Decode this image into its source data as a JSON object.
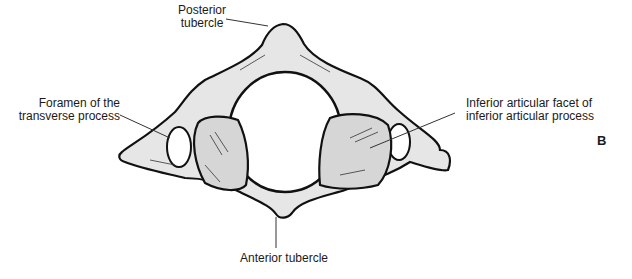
{
  "figure": {
    "panel_letter": "B",
    "colors": {
      "bone_fill": "#e6e6e6",
      "facet_fill": "#d6d6d6",
      "outline": "#111111",
      "leader_line": "#333333"
    }
  },
  "labels": {
    "posterior_tubercle": {
      "line1": "Posterior",
      "line2": "tubercle"
    },
    "foramen_transverse": {
      "line1": "Foramen of the",
      "line2": "transverse process"
    },
    "inferior_facet": {
      "line1": "Inferior articular facet of",
      "line2": "inferior articular process"
    },
    "anterior_tubercle": {
      "line1": "Anterior tubercle"
    }
  }
}
